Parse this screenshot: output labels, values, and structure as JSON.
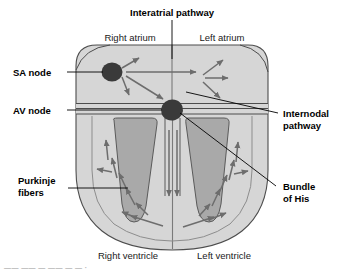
{
  "figure": {
    "callouts": {
      "interatrial_pathway": "Interatrial pathway",
      "sa_node": "SA node",
      "av_node": "AV node",
      "internodal_pathway_line1": "Internodal",
      "internodal_pathway_line2": "pathway",
      "purkinje_line1": "Purkinje",
      "purkinje_line2": "fibers",
      "bundle_of_his_line1": "Bundle",
      "bundle_of_his_line2": "of His"
    },
    "chamber_labels": {
      "right_atrium": "Right atrium",
      "left_atrium": "Left atrium",
      "right_ventricle": "Right ventricle",
      "left_ventricle": "Left ventricle"
    },
    "caption_fragment": "—— —— — —— — — ·",
    "colors": {
      "heart_wall": "#d6d6d6",
      "chamber_fill": "#a9a9a9",
      "node_fill": "#3a3a3a",
      "outline": "#4d4d4d",
      "arrow": "#6d6d6d",
      "leader": "#000000",
      "background": "#ffffff"
    },
    "icon_names": {
      "sa_node": "sa-node-circle",
      "av_node": "av-node-ellipse",
      "conduction_arrow": "conduction-arrow"
    }
  }
}
